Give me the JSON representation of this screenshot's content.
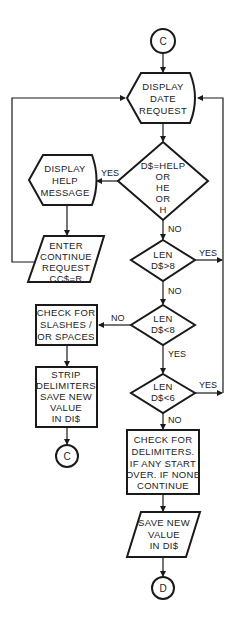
{
  "flowchart": {
    "connectors": {
      "start": "C",
      "loop_back": "C",
      "end": "D"
    },
    "nodes": {
      "display_date": {
        "type": "display",
        "lines": [
          "DISPLAY",
          "DATE",
          "REQUEST"
        ]
      },
      "help_check": {
        "type": "decision",
        "lines": [
          "D$=HELP",
          "OR",
          "HE",
          "OR",
          "H"
        ]
      },
      "display_help": {
        "type": "display",
        "lines": [
          "DISPLAY",
          "HELP",
          "MESSAGE"
        ]
      },
      "enter_continue": {
        "type": "input",
        "lines": [
          "ENTER",
          "CONTINUE",
          "REQUEST",
          "CC$=R"
        ]
      },
      "len_gt_8": {
        "type": "decision",
        "lines": [
          "LEN",
          "D$>8"
        ]
      },
      "len_lt_8": {
        "type": "decision",
        "lines": [
          "LEN",
          "D$<8"
        ]
      },
      "check_slashes": {
        "type": "process",
        "lines": [
          "CHECK FOR",
          "SLASHES /",
          "OR SPACES"
        ]
      },
      "strip_delimiters": {
        "type": "process",
        "lines": [
          "STRIP",
          "DELIMITERS",
          "SAVE NEW",
          "VALUE",
          "IN DI$"
        ]
      },
      "len_lt_6": {
        "type": "decision",
        "lines": [
          "LEN",
          "D$<6"
        ]
      },
      "check_delimiters": {
        "type": "process",
        "lines": [
          "CHECK FOR",
          "DELIMITERS.",
          "IF ANY START",
          "OVER. IF NONE",
          "CONTINUE"
        ]
      },
      "save_value": {
        "type": "input",
        "lines": [
          "SAVE NEW",
          "VALUE",
          "IN DI$"
        ]
      }
    },
    "edge_labels": {
      "help_yes": "YES",
      "help_no": "NO",
      "gt8_yes": "YES",
      "gt8_no": "NO",
      "lt8_no": "NO",
      "lt8_yes": "YES",
      "lt6_yes": "YES",
      "lt6_no": "NO"
    }
  }
}
